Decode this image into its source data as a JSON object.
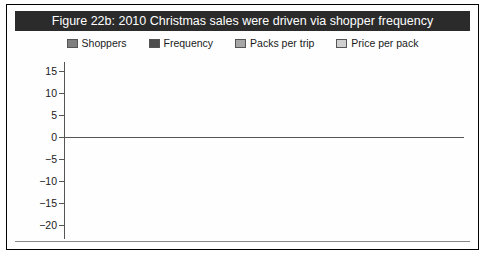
{
  "figure": {
    "title": "Figure 22b: 2010 Christmas sales were driven via shopper frequency",
    "title_bg": "#2b2b2b",
    "title_color": "#ffffff"
  },
  "legend": {
    "position": "top",
    "items": [
      {
        "label": "Shoppers",
        "color": "#7f7f7f",
        "icon": "legend-swatch-icon"
      },
      {
        "label": "Frequency",
        "color": "#4d4d4d",
        "icon": "legend-swatch-icon"
      },
      {
        "label": "Packs per trip",
        "color": "#a6a6a6",
        "icon": "legend-swatch-icon"
      },
      {
        "label": "Price per pack",
        "color": "#cfcfcf",
        "icon": "legend-swatch-icon"
      }
    ]
  },
  "chart_data": {
    "type": "bar",
    "subtype": "stacked-bar",
    "title": "Figure 22b: 2010 Christmas sales were driven via shopper frequency",
    "xlabel": "",
    "ylabel": "",
    "ylim": [
      -20,
      15
    ],
    "yticks": [
      15,
      10,
      5,
      0,
      -5,
      -10,
      -15,
      -20
    ],
    "ytick_labels": [
      "15",
      "10",
      "5",
      "0",
      "−5",
      "−10",
      "−15",
      "−20"
    ],
    "grid": false,
    "legend_position": "top",
    "categories": [
      "Market",
      "Sainsbury's",
      "Waitrose",
      "M&S"
    ],
    "series": [
      {
        "name": "Shoppers",
        "color": "#7f7f7f",
        "values": [
          -0.7,
          3.0,
          0.3,
          -8.0
        ]
      },
      {
        "name": "Frequency",
        "color": "#4d4d4d",
        "values": [
          5.2,
          4.0,
          7.8,
          7.0
        ]
      },
      {
        "name": "Packs per trip",
        "color": "#a6a6a6",
        "values": [
          0.0,
          0.0,
          0.0,
          0.0
        ]
      },
      {
        "name": "Price per pack",
        "color": "#cfcfcf",
        "values": [
          1.3,
          1.0,
          0.7,
          6.0
        ]
      }
    ],
    "totals": [
      6.5,
      8.0,
      8.5,
      13.0
    ]
  },
  "axis": {
    "ylabels": [
      "15",
      "10",
      "5",
      "0",
      "−5",
      "−10",
      "−15",
      "−20"
    ]
  },
  "categories": [
    {
      "label": "Market"
    },
    {
      "label": "Sainsbury's"
    },
    {
      "label": "Waitrose"
    },
    {
      "label": "M&S"
    }
  ]
}
